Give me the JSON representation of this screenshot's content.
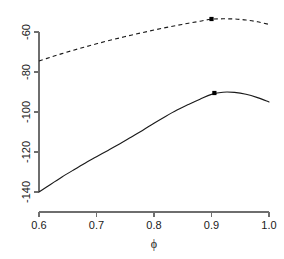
{
  "chart_data": {
    "type": "line",
    "title": "",
    "xlabel": "ϕ",
    "ylabel": "",
    "xlim": [
      0.6,
      1.0
    ],
    "ylim": [
      -140,
      -53
    ],
    "grid": false,
    "legend": "none",
    "xticks": [
      0.6,
      0.7,
      0.8,
      0.9,
      1.0
    ],
    "xtick_labels": [
      "0.6",
      "0.7",
      "0.8",
      "0.9",
      "1.0"
    ],
    "yticks": [
      -60,
      -80,
      -100,
      -120,
      -140
    ],
    "ytick_labels": [
      "-60",
      "-80",
      "-100",
      "-120",
      "-140"
    ],
    "series": [
      {
        "name": "solid-curve",
        "style": "solid",
        "color": "#1a1a1a",
        "x": [
          0.6,
          0.62,
          0.64,
          0.66,
          0.68,
          0.7,
          0.72,
          0.74,
          0.76,
          0.78,
          0.8,
          0.82,
          0.84,
          0.86,
          0.88,
          0.9,
          0.92,
          0.94,
          0.96,
          0.98,
          1.0
        ],
        "values": [
          -140.0,
          -136.2,
          -132.5,
          -129.0,
          -125.6,
          -122.4,
          -119.2,
          -116.0,
          -112.6,
          -109.2,
          -105.6,
          -102.2,
          -99.0,
          -96.2,
          -93.6,
          -91.2,
          -90.1,
          -90.2,
          -91.1,
          -92.8,
          -95.0
        ],
        "marker_point": {
          "x": 0.905,
          "y": -90.5
        }
      },
      {
        "name": "dashed-curve",
        "style": "dashed",
        "color": "#1a1a1a",
        "x": [
          0.6,
          0.62,
          0.64,
          0.66,
          0.68,
          0.7,
          0.72,
          0.74,
          0.76,
          0.78,
          0.8,
          0.82,
          0.84,
          0.86,
          0.88,
          0.9,
          0.92,
          0.94,
          0.96,
          0.98,
          1.0
        ],
        "values": [
          -74.5,
          -72.6,
          -70.8,
          -69.1,
          -67.5,
          -65.9,
          -64.4,
          -63.0,
          -61.6,
          -60.3,
          -59.0,
          -57.8,
          -56.7,
          -55.6,
          -54.6,
          -53.6,
          -53.4,
          -53.5,
          -54.0,
          -54.9,
          -56.2
        ],
        "marker_point": {
          "x": 0.9,
          "y": -53.5
        }
      }
    ]
  },
  "axes": {
    "x_axis_name": "phi-axis",
    "y_axis_name": "loglik-axis"
  }
}
